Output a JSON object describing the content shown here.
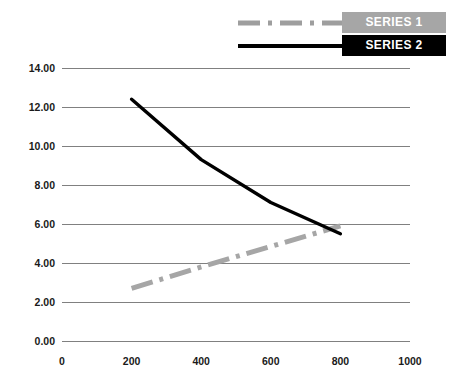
{
  "chart_data": {
    "type": "line",
    "title": "",
    "subtitle": "",
    "xlabel": "",
    "ylabel": "",
    "xlim": [
      0,
      1000
    ],
    "ylim": [
      0,
      14
    ],
    "xticks": [
      0,
      200,
      400,
      600,
      800,
      1000
    ],
    "xtick_labels": [
      "0",
      "200",
      "400",
      "600",
      "800",
      "1000"
    ],
    "yticks": [
      0,
      2,
      4,
      6,
      8,
      10,
      12,
      14
    ],
    "ytick_labels": [
      "0.00",
      "2.00",
      "4.00",
      "6.00",
      "8.00",
      "10.00",
      "12.00",
      "14.00"
    ],
    "grid": "horizontal",
    "legend_position": "top-right",
    "series": [
      {
        "name": "SERIES 1",
        "style": "dash-dot",
        "color": "#a6a6a6",
        "label_background": "#a6a6a6",
        "label_color": "#ffffff",
        "x": [
          200,
          400,
          600,
          800
        ],
        "values": [
          2.7,
          3.8,
          4.85,
          5.9
        ]
      },
      {
        "name": "SERIES 2",
        "style": "solid",
        "color": "#000000",
        "label_background": "#000000",
        "label_color": "#ffffff",
        "x": [
          200,
          400,
          600,
          800
        ],
        "values": [
          12.4,
          9.3,
          7.1,
          5.5
        ]
      }
    ]
  },
  "legend": {
    "entries": [
      {
        "label": "SERIES 1"
      },
      {
        "label": "SERIES 2"
      }
    ]
  },
  "colors": {
    "series1": "#a6a6a6",
    "series2": "#000000",
    "gridline": "#808080",
    "background": "#ffffff",
    "tick_text": "#1a1a1a"
  }
}
